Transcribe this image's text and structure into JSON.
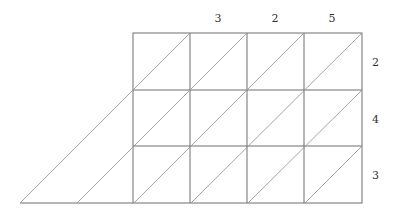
{
  "diagram": {
    "type": "lattice-multiplication",
    "top_digits": [
      "3",
      "2",
      "5"
    ],
    "right_digits": [
      "2",
      "4",
      "3"
    ],
    "grid": {
      "columns": 4,
      "rows": 3
    },
    "colors": {
      "grid_line": "#6e6e6e",
      "diagonal": "#9a9a9a",
      "text": "#333333"
    }
  }
}
